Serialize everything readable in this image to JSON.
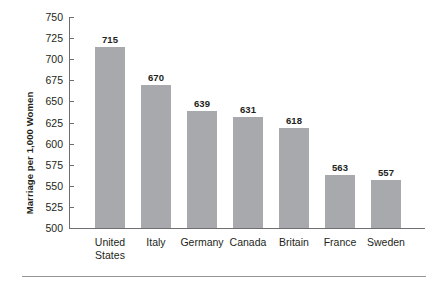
{
  "chart_data": {
    "type": "bar",
    "title": "",
    "subtitle": "",
    "xlabel": "",
    "ylabel": "Marriage per 1,000 Women",
    "ylim": [
      500,
      750
    ],
    "ytick_step": 25,
    "yticks": [
      750,
      725,
      700,
      675,
      650,
      625,
      600,
      575,
      550,
      525,
      500
    ],
    "ytick_labels": [
      "750",
      "725",
      "700",
      "675",
      "650",
      "625",
      "600",
      "575",
      "550",
      "525",
      "500"
    ],
    "categories": [
      "United States",
      "Italy",
      "Germany",
      "Canada",
      "Britain",
      "France",
      "Sweden"
    ],
    "category_labels": [
      [
        "United",
        "States"
      ],
      [
        "Italy"
      ],
      [
        "Germany"
      ],
      [
        "Canada"
      ],
      [
        "Britain"
      ],
      [
        "France"
      ],
      [
        "Sweden"
      ]
    ],
    "values": [
      715,
      670,
      639,
      631,
      618,
      563,
      557
    ],
    "value_labels": [
      "715",
      "670",
      "639",
      "631",
      "618",
      "563",
      "557"
    ],
    "grid": false,
    "legend": "none",
    "bar_color": "#a8a9ad",
    "axis_color": "#6d6e71",
    "text_color": "#231f20"
  }
}
